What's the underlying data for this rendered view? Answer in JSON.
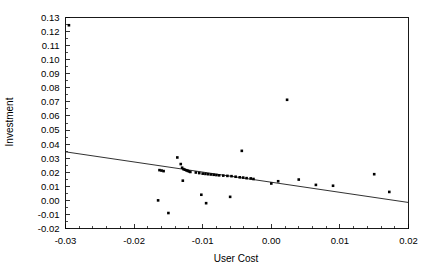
{
  "chart_data": {
    "type": "scatter",
    "title": "",
    "xlabel": "User Cost",
    "ylabel": "Investment",
    "xlim": [
      -0.03,
      0.02
    ],
    "ylim": [
      -0.02,
      0.13
    ],
    "xticks": [
      -0.03,
      -0.02,
      -0.01,
      0.0,
      0.01,
      0.02
    ],
    "xticklabels": [
      "-0.03",
      "-0.02",
      "-0.01",
      "0.00",
      "0.01",
      "0.02"
    ],
    "yticks": [
      -0.02,
      -0.01,
      0.0,
      0.01,
      0.02,
      0.03,
      0.04,
      0.05,
      0.06,
      0.07,
      0.08,
      0.09,
      0.1,
      0.11,
      0.12,
      0.13
    ],
    "yticklabels": [
      "-0.02",
      "-0.01",
      "0.00",
      "0.01",
      "0.02",
      "0.03",
      "0.04",
      "0.05",
      "0.06",
      "0.07",
      "0.08",
      "0.09",
      "0.10",
      "0.11",
      "0.12",
      "0.13"
    ],
    "grid": false,
    "legend": null,
    "marker": "square",
    "marker_size": 2.6,
    "point_color": "#000000",
    "line_color": "#1a1a1a",
    "minor_ticks": true,
    "x": [
      -0.0295,
      -0.0163,
      -0.016,
      -0.0157,
      -0.0137,
      -0.0132,
      -0.013,
      -0.0128,
      -0.0126,
      -0.0124,
      -0.0122,
      -0.012,
      -0.0118,
      -0.0129,
      -0.0165,
      -0.015,
      -0.011,
      -0.0105,
      -0.01,
      -0.0096,
      -0.0092,
      -0.0088,
      -0.0084,
      -0.008,
      -0.0076,
      -0.0102,
      -0.0095,
      -0.007,
      -0.0064,
      -0.0058,
      -0.0052,
      -0.0046,
      -0.0041,
      -0.0036,
      -0.003,
      -0.0026,
      -0.006,
      -0.0043,
      0.0,
      0.001,
      0.0023,
      0.004,
      0.0065,
      0.009,
      0.015,
      0.0172
    ],
    "y": [
      0.1245,
      0.0215,
      0.0212,
      0.0208,
      0.0305,
      0.0258,
      0.0232,
      0.0222,
      0.0218,
      0.0214,
      0.021,
      0.0206,
      0.0202,
      0.014,
      0.0,
      -0.009,
      0.0198,
      0.0194,
      0.019,
      0.0188,
      0.0186,
      0.0184,
      0.0182,
      0.018,
      0.0178,
      0.004,
      -0.002,
      0.0176,
      0.0174,
      0.0172,
      0.0168,
      0.0164,
      0.0162,
      0.0158,
      0.0156,
      0.0152,
      0.0025,
      0.0352,
      0.012,
      0.0136,
      0.0715,
      0.0148,
      0.011,
      0.0104,
      0.0186,
      0.006
    ],
    "fit_line": {
      "label": "least-squares fit",
      "x": [
        -0.03,
        0.02
      ],
      "y": [
        0.0345,
        -0.0015
      ],
      "slope": -0.72,
      "intercept": 0.013
    },
    "n_points": 46
  },
  "axes": {
    "x_title": "User Cost",
    "y_title": "Investment"
  }
}
